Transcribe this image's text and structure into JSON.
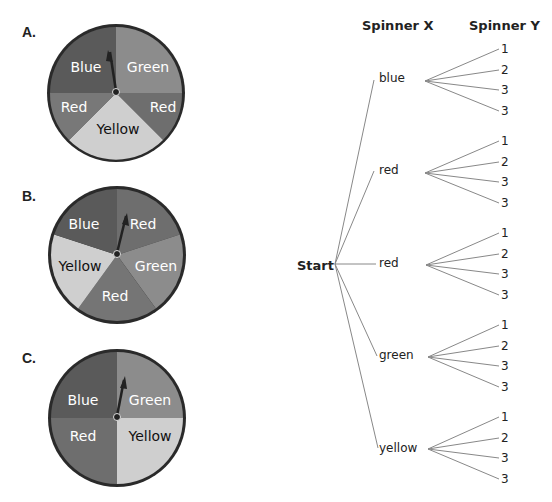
{
  "spinners": {
    "a": {
      "letter": "A.",
      "sections": [
        "Blue",
        "Green",
        "Red",
        "Yellow",
        "Red"
      ]
    },
    "b": {
      "letter": "B.",
      "sections": [
        "Blue",
        "Red",
        "Green",
        "Red",
        "Yellow"
      ]
    },
    "c": {
      "letter": "C.",
      "sections": [
        "Blue",
        "Green",
        "Red",
        "Yellow"
      ]
    }
  },
  "colors": {
    "blue": "#5a5a5a",
    "green": "#8c8c8c",
    "red": "#6e6e6e",
    "yellow": "#cfcfcf",
    "rim": "#2a2a2a",
    "line": "#888888"
  },
  "tree": {
    "header_x": "Spinner X",
    "header_y": "Spinner Y",
    "root": "Start",
    "branches": [
      {
        "label": "blue",
        "outcomes": [
          "1",
          "2",
          "3",
          "3"
        ]
      },
      {
        "label": "red",
        "outcomes": [
          "1",
          "2",
          "3",
          "3"
        ]
      },
      {
        "label": "red",
        "outcomes": [
          "1",
          "2",
          "3",
          "3"
        ]
      },
      {
        "label": "green",
        "outcomes": [
          "1",
          "2",
          "3",
          "3"
        ]
      },
      {
        "label": "yellow",
        "outcomes": [
          "1",
          "2",
          "3",
          "3"
        ]
      }
    ]
  }
}
